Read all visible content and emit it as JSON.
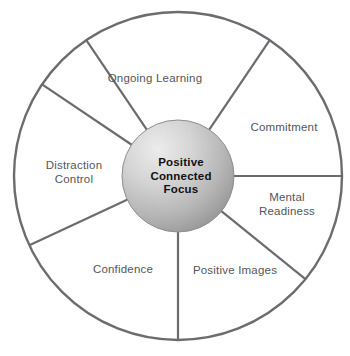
{
  "diagram": {
    "type": "wheel",
    "colors": {
      "stroke": "#6b6b70",
      "label_text": "#55555a",
      "hub_text": "#111111",
      "hub_gradient_light": "#e6e6e6",
      "hub_gradient_mid": "#c3c3c3",
      "hub_gradient_dark": "#9a9a9a",
      "background": "#ffffff"
    },
    "geometry": {
      "center_x": 178,
      "center_y": 176,
      "outer_radius": 164,
      "hub_radius": 56
    },
    "hub": {
      "label": "Positive\nConnected\nFocus",
      "label_x": 181,
      "label_y": 176
    },
    "sectors": [
      {
        "id": "ongoing-learning",
        "label": "Ongoing Learning",
        "label_x": 155,
        "label_y": 79,
        "start_angle": -124,
        "end_angle": -56
      },
      {
        "id": "commitment",
        "label": "Commitment",
        "label_x": 284,
        "label_y": 128,
        "start_angle": -56,
        "end_angle": 0
      },
      {
        "id": "mental-readiness",
        "label": "Mental\nReadiness",
        "label_x": 287,
        "label_y": 204,
        "start_angle": 0,
        "end_angle": 39
      },
      {
        "id": "positive-images",
        "label": "Positive Images",
        "label_x": 235,
        "label_y": 271,
        "start_angle": 39,
        "end_angle": 90
      },
      {
        "id": "confidence",
        "label": "Confidence",
        "label_x": 123,
        "label_y": 270,
        "start_angle": 90,
        "end_angle": 155
      },
      {
        "id": "distraction-control",
        "label": "Distraction\nControl",
        "label_x": 74,
        "label_y": 172,
        "start_angle": 155,
        "end_angle": 214
      }
    ]
  }
}
